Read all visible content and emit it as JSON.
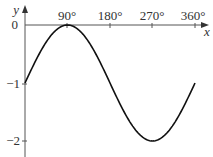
{
  "chart_data": {
    "type": "line",
    "title": "",
    "xlabel": "x",
    "ylabel": "y",
    "function": "y = sin(x) - 1",
    "x_ticks": [
      90,
      180,
      270,
      360
    ],
    "x_tick_labels": [
      "90°",
      "180°",
      "270°",
      "360°"
    ],
    "y_ticks": [
      0,
      -1,
      -2
    ],
    "y_tick_labels": [
      "0",
      "−1",
      "−2"
    ],
    "xlim": [
      0,
      360
    ],
    "ylim": [
      -2,
      0
    ],
    "grid": false,
    "series": [
      {
        "name": "y = sin x − 1",
        "x": [
          0,
          30,
          60,
          90,
          120,
          150,
          180,
          210,
          240,
          270,
          300,
          330,
          360
        ],
        "y": [
          -1,
          -0.5,
          -0.134,
          0,
          -0.134,
          -0.5,
          -1,
          -1.5,
          -1.866,
          -2,
          -1.866,
          -1.5,
          -1
        ]
      }
    ],
    "colors": {
      "curve": "#111111",
      "axes": "#555555",
      "text": "#333333"
    }
  },
  "labels": {
    "x_axis": "x",
    "y_axis": "y",
    "xt0": "90°",
    "xt1": "180°",
    "xt2": "270°",
    "xt3": "360°",
    "yt0": "0",
    "yt1": "−1",
    "yt2": "−2"
  }
}
